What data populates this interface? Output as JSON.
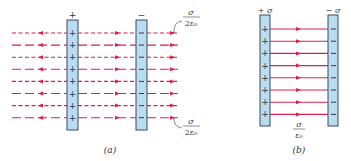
{
  "figure_a": {
    "caption": "(a)",
    "plate_left": {
      "sign_label": "+",
      "charge_symbol": "+"
    },
    "plate_right": {
      "sign_label": "−",
      "charge_symbol": "−"
    },
    "field_label_top": {
      "numerator": "σ",
      "denominator": "2ε₀"
    },
    "field_label_bottom": {
      "numerator": "σ",
      "denominator": "2ε₀"
    },
    "line_count": 8
  },
  "figure_b": {
    "caption": "(b)",
    "plate_left": {
      "sign_label": "+ σ",
      "charge_symbol": "+"
    },
    "plate_right": {
      "sign_label": "− σ",
      "charge_symbol": "−"
    },
    "field_label": {
      "numerator": "σ",
      "denominator": "ε₀"
    },
    "line_count": 8
  },
  "colors": {
    "field_line": "#d9204a",
    "plate_fill": "#b9dcf0",
    "plate_edge": "#3a4a5a",
    "text": "#333333"
  }
}
